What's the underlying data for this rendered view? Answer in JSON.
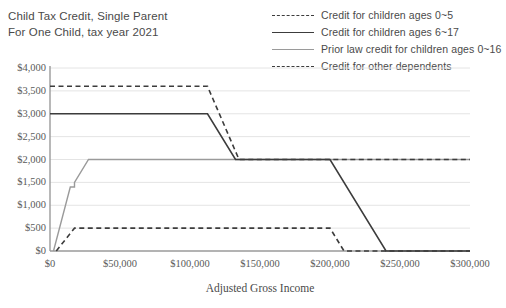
{
  "chart_data": {
    "type": "line",
    "title": "Child Tax Credit, Single Parent For One Child, tax year 2021",
    "title_lines": [
      "Child Tax Credit, Single Parent",
      "For One Child, tax year 2021"
    ],
    "xlabel": "Adjusted Gross Income",
    "ylabel": "",
    "xlim": [
      0,
      300000
    ],
    "ylim": [
      0,
      4000
    ],
    "xticks": [
      0,
      50000,
      100000,
      150000,
      200000,
      250000,
      300000
    ],
    "xtick_labels": [
      "$0",
      "$50,000",
      "$100,000",
      "$150,000",
      "$200,000",
      "$250,000",
      "$300,000"
    ],
    "yticks": [
      0,
      500,
      1000,
      1500,
      2000,
      2500,
      3000,
      3500,
      4000
    ],
    "ytick_labels": [
      "$0",
      "$500",
      "$1,000",
      "$1,500",
      "$2,000",
      "$2,500",
      "$3,000",
      "$3,500",
      "$4,000"
    ],
    "grid": "horizontal",
    "legend_position": "top-right",
    "series": [
      {
        "name": "Credit for children ages 0~5",
        "style": "dashed",
        "color": "#3c3c3c",
        "width": 1.6,
        "points": [
          [
            0,
            3600
          ],
          [
            112500,
            3600
          ],
          [
            135000,
            2000
          ],
          [
            300000,
            2000
          ]
        ]
      },
      {
        "name": "Credit for children ages 6~17",
        "style": "solid",
        "color": "#3c3c3c",
        "width": 1.6,
        "points": [
          [
            0,
            3000
          ],
          [
            112500,
            3000
          ],
          [
            132500,
            2000
          ],
          [
            200000,
            2000
          ],
          [
            240000,
            0
          ],
          [
            300000,
            0
          ]
        ]
      },
      {
        "name": "Prior law credit for children ages 0~16",
        "style": "solid",
        "color": "#9a9a9a",
        "width": 1.4,
        "points": [
          [
            2500,
            0
          ],
          [
            14500,
            1400
          ],
          [
            17500,
            1400
          ],
          [
            17500,
            1500
          ],
          [
            27500,
            2000
          ],
          [
            300000,
            2000
          ]
        ]
      },
      {
        "name": "Credit for other dependents",
        "style": "dashed",
        "color": "#3c3c3c",
        "width": 1.6,
        "points": [
          [
            4500,
            0
          ],
          [
            17500,
            500
          ],
          [
            200000,
            500
          ],
          [
            210000,
            0
          ],
          [
            300000,
            0
          ]
        ]
      }
    ]
  },
  "legend": {
    "entries": [
      {
        "label": "Credit for children ages 0~5",
        "style": "dashed",
        "color": "#3c3c3c"
      },
      {
        "label": "Credit for children ages 6~17",
        "style": "solid",
        "color": "#3c3c3c"
      },
      {
        "label": "Prior law credit for children ages 0~16",
        "style": "solid",
        "color": "#9a9a9a"
      },
      {
        "label": "Credit for other dependents",
        "style": "dashed",
        "color": "#3c3c3c"
      }
    ]
  },
  "colors": {
    "axis": "#9a9a9a",
    "grid": "#e4e4e4",
    "text": "#4a4a4a",
    "primary": "#3c3c3c",
    "secondary": "#9a9a9a",
    "background": "#ffffff"
  }
}
